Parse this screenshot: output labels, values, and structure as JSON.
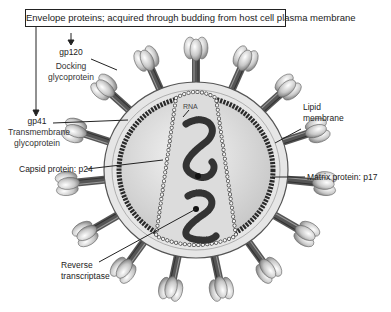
{
  "header": {
    "text": "Envelope proteins; acquired through budding from host cell plasma membrane"
  },
  "labels": {
    "gp120": {
      "name": "gp120",
      "desc_line1": "Docking",
      "desc_line2": "glycoprotein"
    },
    "gp41": {
      "name": "gp41",
      "desc_line1": "Transmembrane",
      "desc_line2": "glycoprotein"
    },
    "capsid": {
      "text": "Capsid protein: p24"
    },
    "reverse_transcriptase": {
      "line1": "Reverse",
      "line2": "transcriptase"
    },
    "lipid_membrane": {
      "line1": "Lipid",
      "line2": "membrane"
    },
    "matrix": {
      "text": "Matrix protein: p17"
    },
    "rna": {
      "text": "RNA"
    }
  },
  "colors": {
    "line": "#222222",
    "envelope_fill": "#e6e6e6",
    "matrix_beads": "#2a2a2a",
    "core_fill": "#d9d9d9",
    "capsid_beads": "#f2f2f2",
    "rna": "#333333",
    "spike_knob": "#cfcfcf",
    "spike_stalk": "#555555"
  }
}
